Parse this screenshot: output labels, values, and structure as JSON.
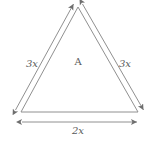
{
  "figure": {
    "type": "geometry-diagram",
    "shape": "triangle",
    "stroke_color": "#808080",
    "text_color": "#595959",
    "background_color": "#ffffff",
    "vertices": {
      "apex": [
        78,
        7
      ],
      "bottom_left": [
        21,
        112
      ],
      "bottom_right": [
        138,
        112
      ]
    },
    "labels": {
      "left_side": "3x",
      "right_side": "3x",
      "base": "2x",
      "area": "A"
    },
    "label_positions": {
      "left_side": [
        32,
        64
      ],
      "right_side": [
        125,
        64
      ],
      "base": [
        78,
        131
      ],
      "area": [
        78,
        62
      ]
    },
    "dimension_lines": [
      {
        "name": "left-side-dimension",
        "value": "3x",
        "arrows": "both"
      },
      {
        "name": "right-side-dimension",
        "value": "3x",
        "arrows": "both"
      },
      {
        "name": "base-dimension",
        "value": "2x",
        "arrows": "both"
      }
    ]
  }
}
